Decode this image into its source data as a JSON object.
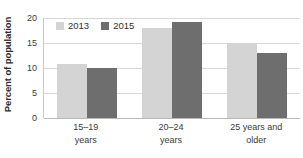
{
  "chart_data": {
    "type": "bar",
    "title": "",
    "subtitle": "",
    "xlabel": "",
    "ylabel": "Percent of population",
    "ylim": [
      0,
      20
    ],
    "ytick_values": [
      0,
      5,
      10,
      15,
      20
    ],
    "ytick_labels": [
      "0",
      "5",
      "10",
      "15",
      "20"
    ],
    "grid": true,
    "grid_axis": "y",
    "legend_position": "top-left-inside",
    "categories": [
      "15–19\nyears",
      "20–24\nyears",
      "25 years and\nolder"
    ],
    "series": [
      {
        "name": "2013",
        "color": "#d4d4d4",
        "values": [
          10.8,
          18.1,
          15.0
        ]
      },
      {
        "name": "2015",
        "color": "#6e6e6e",
        "values": [
          10.0,
          19.2,
          13.0
        ]
      }
    ],
    "annotations": []
  },
  "legend": {
    "items": [
      {
        "label": "2013",
        "color": "#d4d4d4",
        "swatch_name": "legend-swatch-2013"
      },
      {
        "label": "2015",
        "color": "#6e6e6e",
        "swatch_name": "legend-swatch-2015"
      }
    ]
  },
  "colors": {
    "background": "#ffffff",
    "gridline": "#d8d8d8",
    "axis": "#b8b8b8",
    "text": "#3a3a3a",
    "title_text": "#2b2b2b"
  }
}
